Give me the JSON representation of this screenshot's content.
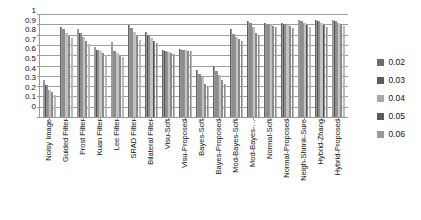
{
  "chart_data": {
    "type": "bar",
    "title": "",
    "xlabel": "",
    "ylabel": "",
    "ylim": [
      0,
      1
    ],
    "grid": true,
    "legend_position": "right",
    "y_ticks": [
      "1",
      "0.9",
      "0.8",
      "0.7",
      "0.6",
      "0.5",
      "0.4",
      "0.3",
      "0.2",
      "0.1",
      "0"
    ],
    "categories": [
      "Noisy Image",
      "Guided Filter",
      "Frost Filter",
      "Kuan Filter",
      "Lee Filter",
      "SRAD Filter",
      "Bilateral Filter",
      "Visu-Soft",
      "Visu-Proposed",
      "Bayes-Soft",
      "Bayes-Proposed",
      "Mod-Bayes-Soft",
      "Mod-Bayes-…",
      "Normal-Soft",
      "Normal-Proposed",
      "Neigh-Shrink-Sure",
      "Hybrid-Zhang",
      "Hybrid-Proposed"
    ],
    "series": [
      {
        "name": "0.02",
        "color": "#6e6e6e",
        "values": [
          0.36,
          0.87,
          0.85,
          0.68,
          0.73,
          0.89,
          0.83,
          0.65,
          0.66,
          0.46,
          0.5,
          0.85,
          0.93,
          0.91,
          0.91,
          0.94,
          0.94,
          0.94
        ]
      },
      {
        "name": "0.03",
        "color": "#5c5c5c",
        "values": [
          0.31,
          0.85,
          0.82,
          0.65,
          0.64,
          0.86,
          0.8,
          0.64,
          0.65,
          0.42,
          0.45,
          0.81,
          0.91,
          0.9,
          0.9,
          0.93,
          0.93,
          0.93
        ]
      },
      {
        "name": "0.04",
        "color": "#a8a8a8",
        "values": [
          0.26,
          0.82,
          0.78,
          0.64,
          0.62,
          0.83,
          0.77,
          0.63,
          0.65,
          0.39,
          0.41,
          0.78,
          0.87,
          0.89,
          0.89,
          0.91,
          0.91,
          0.91
        ]
      },
      {
        "name": "0.05",
        "color": "#5a5a5a",
        "values": [
          0.24,
          0.79,
          0.74,
          0.62,
          0.6,
          0.79,
          0.74,
          0.62,
          0.64,
          0.32,
          0.36,
          0.76,
          0.82,
          0.88,
          0.88,
          0.89,
          0.89,
          0.9
        ]
      },
      {
        "name": "0.06",
        "color": "#9c9c9c",
        "values": [
          0.21,
          0.77,
          0.71,
          0.6,
          0.58,
          0.75,
          0.72,
          0.61,
          0.64,
          0.3,
          0.32,
          0.74,
          0.8,
          0.87,
          0.86,
          0.87,
          0.87,
          0.88
        ]
      }
    ]
  },
  "legend": {
    "items": [
      {
        "label": "0.02"
      },
      {
        "label": "0.03"
      },
      {
        "label": "0.04"
      },
      {
        "label": "0.05"
      },
      {
        "label": "0.06"
      }
    ]
  }
}
